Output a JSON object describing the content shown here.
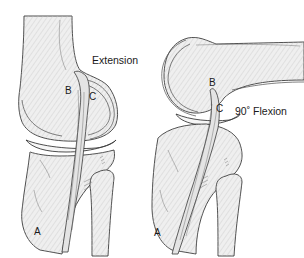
{
  "figure": {
    "panels": [
      {
        "id": "extension",
        "title": "Extension",
        "labels": {
          "a": "A",
          "b": "B",
          "c": "C"
        }
      },
      {
        "id": "flexion",
        "title": "90˚ Flexion",
        "labels": {
          "a": "A",
          "b": "B",
          "c": "C"
        }
      }
    ]
  }
}
